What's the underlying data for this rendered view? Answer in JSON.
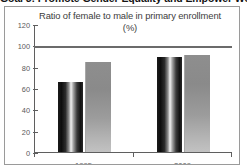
{
  "slide": {
    "header": "Goal 3: Promote Gender Equality and Empower Women"
  },
  "chart_panel": {
    "title_line1": "Ratio of female to male in primary enrollment",
    "title_line2": "(%)"
  },
  "chart_data": {
    "type": "bar",
    "title": "Ratio of female to male in primary enrollment (%)",
    "xlabel": "",
    "ylabel": "",
    "ylim": [
      0,
      120
    ],
    "yticks": [
      0,
      20,
      40,
      60,
      80,
      100,
      120
    ],
    "ytick_labels": [
      "0",
      "20",
      "40",
      "60",
      "80",
      "100",
      "120"
    ],
    "grid": false,
    "legend": "none",
    "categories": [
      "1995",
      "2009"
    ],
    "series": [
      {
        "name": "series-1",
        "color": "#111111",
        "values": [
          66,
          89
        ]
      },
      {
        "name": "series-2",
        "color": "#999999",
        "values": [
          84,
          91
        ]
      }
    ],
    "annotations": [
      {
        "type": "reference-line",
        "axis": "y",
        "value": 100,
        "color": "#6b6b6b"
      }
    ]
  }
}
